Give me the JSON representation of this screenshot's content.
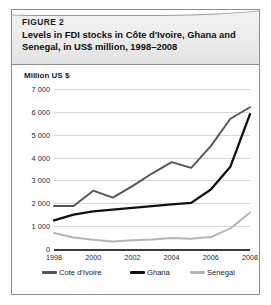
{
  "figure": {
    "label": "FIGURE 2",
    "title": "Levels in FDI stocks in Côte d'Ivoire, Ghana and Senegal, in US$ million, 1998–2008"
  },
  "axis_unit_label": "Million US $",
  "legend": {
    "items": [
      {
        "label": "Cote d'Ivoire",
        "color": "#555555"
      },
      {
        "label": "Ghana",
        "color": "#111111"
      },
      {
        "label": "Senegal",
        "color": "#b5b5b5"
      }
    ]
  },
  "chart_data": {
    "type": "line",
    "title": "Levels in FDI stocks in Côte d'Ivoire, Ghana and Senegal, in US$ million, 1998–2008",
    "xlabel": "",
    "ylabel": "Million US $",
    "ylim": [
      0,
      7000
    ],
    "xlim": [
      1998,
      2008
    ],
    "grid": true,
    "legend_position": "bottom",
    "yticks": [
      0,
      1000,
      2000,
      3000,
      4000,
      5000,
      6000,
      7000
    ],
    "ytick_labels": [
      "0",
      "1 000",
      "2 000",
      "3 000",
      "4 000",
      "5 000",
      "6 000",
      "7 000"
    ],
    "x": [
      1998,
      1999,
      2000,
      2001,
      2002,
      2003,
      2004,
      2005,
      2006,
      2007,
      2008
    ],
    "xticks": [
      1998,
      2000,
      2002,
      2004,
      2006,
      2008
    ],
    "xtick_labels": [
      "1998",
      "2000",
      "2002",
      "2004",
      "2006",
      "2008"
    ],
    "series": [
      {
        "name": "Cote d'Ivoire",
        "color": "#555555",
        "width": 1.9,
        "values": [
          1880,
          1880,
          2550,
          2250,
          2750,
          3300,
          3800,
          3550,
          4500,
          5700,
          6200
        ]
      },
      {
        "name": "Ghana",
        "color": "#111111",
        "width": 2.3,
        "values": [
          1250,
          1500,
          1650,
          1720,
          1800,
          1880,
          1950,
          2020,
          2600,
          3600,
          5900
        ]
      },
      {
        "name": "Senegal",
        "color": "#b5b5b5",
        "width": 2.0,
        "values": [
          700,
          500,
          400,
          330,
          380,
          420,
          480,
          450,
          520,
          900,
          1600
        ]
      }
    ]
  }
}
